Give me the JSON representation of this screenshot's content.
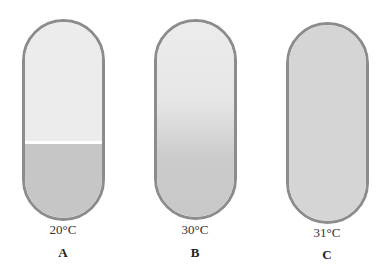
{
  "panels": [
    {
      "id": "A",
      "letter": "A",
      "temperature": "20°C",
      "state": "two separate layers"
    },
    {
      "id": "B",
      "letter": "B",
      "temperature": "30°C",
      "state": "partially mixed gradient"
    },
    {
      "id": "C",
      "letter": "C",
      "temperature": "31°C",
      "state": "single homogeneous phase"
    }
  ],
  "colors": {
    "outline": "#8c8c8c",
    "upper_layer": "#ebebeb",
    "lower_layer": "#c8c8c8",
    "mixed": "#d4d4d4"
  }
}
